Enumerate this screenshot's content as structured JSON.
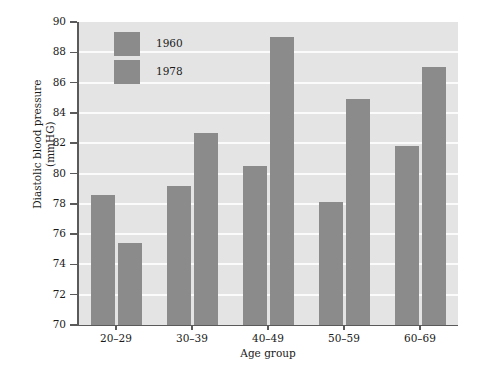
{
  "chart_data": {
    "type": "bar",
    "title": "",
    "subtitle": "",
    "xlabel": "Age group",
    "ylabel_lines": [
      "Diastolic blood pressure",
      "(mmHG)"
    ],
    "ylabel": "Diastolic blood pressure (mmHG)",
    "categories": [
      "20–29",
      "30–39",
      "40–49",
      "50–59",
      "60–69"
    ],
    "series": [
      {
        "name": "1960",
        "values": [
          78.6,
          79.2,
          80.5,
          78.1,
          81.8
        ]
      },
      {
        "name": "1978",
        "values": [
          75.4,
          82.7,
          89.0,
          84.9,
          87.0
        ]
      }
    ],
    "ylim": [
      70,
      90
    ],
    "yticks": [
      70,
      72,
      74,
      76,
      78,
      80,
      82,
      84,
      86,
      88,
      90
    ],
    "ytick_labels": [
      "70",
      "72",
      "74",
      "76",
      "78",
      "80",
      "82",
      "84",
      "86",
      "88",
      "90"
    ],
    "grid": true,
    "gridlines_at": [
      72,
      74,
      76,
      78,
      80,
      82,
      84,
      86,
      88
    ],
    "legend_position": "top-left-inside",
    "colors": {
      "bar_fill": "#8b8b8b",
      "plot_background": "#e4e4e4",
      "gridline": "#fbfbfb",
      "axis": "#5a5a5a",
      "text": "#1a1a1a",
      "figure_background": "#ffffff"
    }
  },
  "legend": {
    "entries": [
      {
        "label": "1960"
      },
      {
        "label": "1978"
      }
    ]
  }
}
